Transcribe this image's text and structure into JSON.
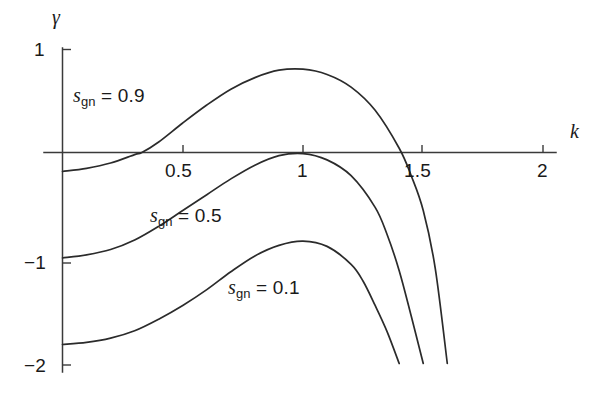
{
  "chart_data": {
    "type": "line",
    "title": "",
    "subtitle": "",
    "xlabel": "k",
    "ylabel": "γ",
    "xlim": [
      -0.26,
      2.28
    ],
    "ylim": [
      -2.0,
      1.0
    ],
    "grid": false,
    "legend_position": "inline-annotations",
    "xticks": [
      0.5,
      1,
      1.5,
      2
    ],
    "xtick_labels": [
      "0.5",
      "1",
      "1.5",
      "2"
    ],
    "yticks": [
      1,
      -1,
      -2
    ],
    "ytick_labels": [
      "1",
      "−1",
      "−2"
    ],
    "series": [
      {
        "name": "s_gn = 0.9",
        "label_text": "= 0.9",
        "label_var": "s",
        "label_sub": "gn",
        "x": [
          0.0,
          0.1,
          0.2,
          0.3,
          0.33,
          0.4,
          0.5,
          0.6,
          0.7,
          0.8,
          0.9,
          1.0,
          1.1,
          1.2,
          1.3,
          1.4,
          1.45,
          1.5,
          1.55,
          1.6
        ],
        "y": [
          -0.18,
          -0.15,
          -0.1,
          -0.02,
          0.0,
          0.1,
          0.28,
          0.45,
          0.6,
          0.71,
          0.78,
          0.79,
          0.74,
          0.62,
          0.4,
          0.04,
          -0.22,
          -0.55,
          -1.1,
          -2.0
        ]
      },
      {
        "name": "s_gn = 0.5",
        "label_text": "= 0.5",
        "label_var": "s",
        "label_sub": "gn",
        "x": [
          0.0,
          0.1,
          0.2,
          0.3,
          0.4,
          0.5,
          0.6,
          0.7,
          0.8,
          0.9,
          1.0,
          1.1,
          1.2,
          1.3,
          1.35,
          1.4,
          1.45,
          1.5
        ],
        "y": [
          -1.0,
          -0.97,
          -0.92,
          -0.83,
          -0.7,
          -0.55,
          -0.4,
          -0.25,
          -0.12,
          -0.03,
          -0.01,
          -0.07,
          -0.22,
          -0.52,
          -0.78,
          -1.12,
          -1.55,
          -2.0
        ]
      },
      {
        "name": "s_gn = 0.1",
        "label_text": "= 0.1",
        "label_var": "s",
        "label_sub": "gn",
        "x": [
          0.0,
          0.1,
          0.2,
          0.3,
          0.4,
          0.5,
          0.6,
          0.7,
          0.8,
          0.9,
          1.0,
          1.1,
          1.2,
          1.25,
          1.3,
          1.35,
          1.4
        ],
        "y": [
          -1.82,
          -1.8,
          -1.76,
          -1.69,
          -1.58,
          -1.45,
          -1.3,
          -1.13,
          -0.98,
          -0.88,
          -0.84,
          -0.89,
          -1.06,
          -1.22,
          -1.45,
          -1.7,
          -2.0
        ]
      }
    ]
  },
  "labels": {
    "y_axis_title": "γ",
    "x_axis_title": "k",
    "ytick_1": "1",
    "ytick_neg1": "−1",
    "ytick_neg2": "−2",
    "xtick_05": "0.5",
    "xtick_1": "1",
    "xtick_15": "1.5",
    "xtick_2": "2",
    "curve_09_var": "s",
    "curve_09_sub": "gn",
    "curve_09_eq": "= 0.9",
    "curve_05_var": "s",
    "curve_05_sub": "gn",
    "curve_05_eq": "= 0.5",
    "curve_01_var": "s",
    "curve_01_sub": "gn",
    "curve_01_eq": "= 0.1"
  },
  "colors": {
    "background": "#ffffff",
    "axis": "#3a3a3a",
    "curve": "#2b2b2b",
    "text": "#1a1a1a"
  }
}
